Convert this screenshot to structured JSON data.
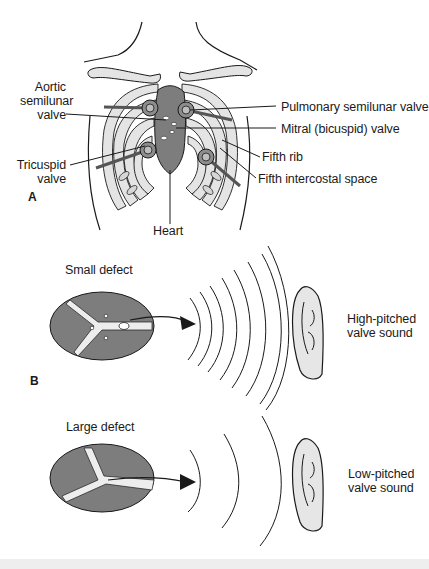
{
  "figure": {
    "panel_a": {
      "letter": "A",
      "labels": {
        "aortic": [
          "Aortic",
          "semilunar",
          "valve"
        ],
        "tricuspid": [
          "Tricuspid",
          "valve"
        ],
        "pulmonary": "Pulmonary semilunar valve",
        "mitral": "Mitral (bicuspid) valve",
        "fifth_rib": "Fifth rib",
        "fifth_intercostal": "Fifth intercostal space",
        "heart": "Heart"
      }
    },
    "panel_b": {
      "letter": "B",
      "small_defect": {
        "title": "Small defect",
        "sound_label": [
          "High-pitched",
          "valve sound"
        ],
        "wave_count": 8
      },
      "large_defect": {
        "title": "Large defect",
        "sound_label": [
          "Low-pitched",
          "valve sound"
        ],
        "wave_count": 3
      }
    }
  },
  "colors": {
    "heart_fill": "#7d7d7d",
    "valve_fill": "#8c8c8c",
    "rib_fill": "#e4e4e4",
    "line": "#1a1a1a",
    "ear_fill": "#e6e6e6",
    "background": "#ffffff"
  }
}
